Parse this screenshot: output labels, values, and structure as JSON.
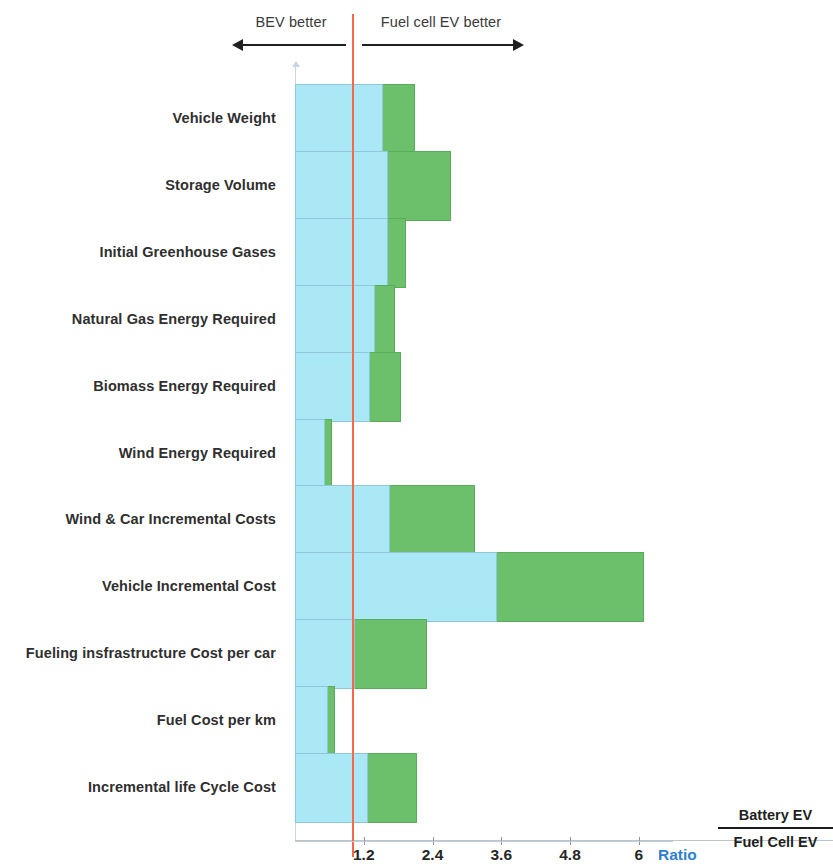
{
  "annotations": {
    "left": {
      "label": "BEV better",
      "direction": "left-arrow"
    },
    "right": {
      "label": "Fuel cell EV better",
      "direction": "right-arrow"
    }
  },
  "axis": {
    "ratio_caption": "Ratio",
    "tick_labels": [
      "1.2",
      "2.4",
      "3.6",
      "4.8",
      "6"
    ],
    "fraction_numerator": "Battery EV",
    "fraction_denominator": "Fuel Cell EV"
  },
  "colors": {
    "primary_segment": "#a9e8f4",
    "secondary_segment": "#6cbf6b",
    "threshold_line": "#f9674a",
    "ratio_text": "#2f7fd0",
    "axis": "#b9c6cd"
  },
  "chart_data": {
    "type": "bar",
    "orientation": "horizontal",
    "stacked": true,
    "title": "",
    "subtitle": "",
    "xlabel": "Ratio  Battery EV / Fuel Cell EV",
    "ylabel": "",
    "xlim": [
      0,
      9.4
    ],
    "xticks": [
      1.2,
      2.4,
      3.6,
      4.8,
      6
    ],
    "grid": false,
    "legend_position": "none",
    "threshold": 1.0,
    "annotations": [
      "BEV better",
      "Fuel cell EV better"
    ],
    "categories": [
      "Vehicle Weight",
      "Storage Volume",
      "Initial Greenhouse Gases",
      "Natural Gas Energy Required",
      "Biomass Energy Required",
      "Wind Energy Required",
      "Wind & Car Incremental Costs",
      "Vehicle Incremental Cost",
      "Fueling insfrastructure Cost per car",
      "Fuel Cost per km",
      "Incremental life Cycle Cost"
    ],
    "series": [
      {
        "name": "Low estimate",
        "color": "#a9e8f4",
        "values": [
          1.54,
          1.62,
          1.62,
          1.4,
          1.31,
          0.52,
          1.66,
          3.53,
          1.05,
          0.58,
          1.27
        ]
      },
      {
        "name": "High estimate",
        "color": "#6cbf6b",
        "values": [
          2.09,
          2.72,
          1.94,
          1.75,
          1.85,
          0.65,
          3.14,
          6.09,
          2.3,
          0.7,
          2.13
        ]
      }
    ]
  }
}
